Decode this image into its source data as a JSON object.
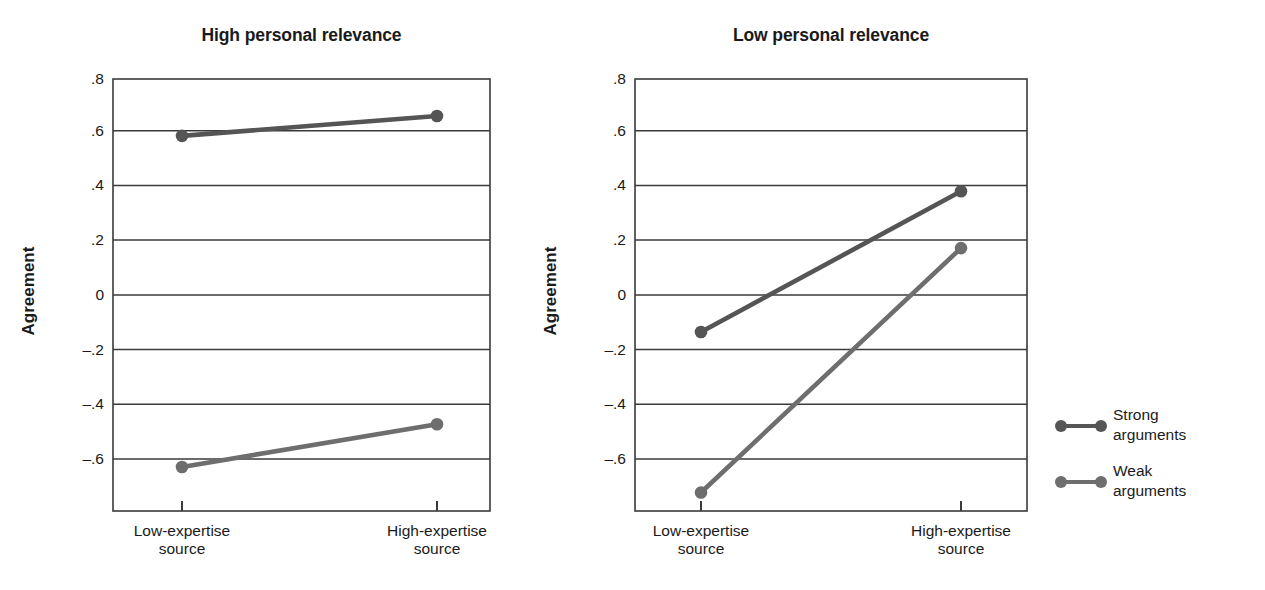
{
  "chart_data": {
    "type": "line",
    "title": "",
    "panels": [
      {
        "title": "High personal relevance",
        "ylabel": "Agreement",
        "xlabel": "",
        "categories": [
          "Low-expertise source",
          "High-expertise source"
        ],
        "category_lines": [
          [
            "Low-expertise",
            "source"
          ],
          [
            "High-expertise",
            "source"
          ]
        ],
        "yticks": [
          ".8",
          ".6",
          ".4",
          ".2",
          "0",
          "–.2",
          "–.4",
          "–.6"
        ],
        "ytick_values": [
          0.8,
          0.6,
          0.4,
          0.2,
          0,
          -0.2,
          -0.4,
          -0.6
        ],
        "ylim": [
          -0.72,
          0.8
        ],
        "grid": true,
        "series": [
          {
            "name": "Strong arguments",
            "values": [
              0.6,
              0.67
            ]
          },
          {
            "name": "Weak arguments",
            "values": [
              -0.565,
              -0.415
            ]
          }
        ]
      },
      {
        "title": "Low personal relevance",
        "ylabel": "Agreement",
        "xlabel": "",
        "categories": [
          "Low-expertise source",
          "High-expertise source"
        ],
        "category_lines": [
          [
            "Low-expertise",
            "source"
          ],
          [
            "High-expertise",
            "source"
          ]
        ],
        "yticks": [
          ".8",
          ".6",
          ".4",
          ".2",
          "0",
          "–.2",
          "–.4",
          "–.6"
        ],
        "ytick_values": [
          0.8,
          0.6,
          0.4,
          0.2,
          0,
          -0.2,
          -0.4,
          -0.6
        ],
        "ylim": [
          -0.72,
          0.8
        ],
        "grid": true,
        "series": [
          {
            "name": "Strong arguments",
            "values": [
              -0.09,
              0.405
            ]
          },
          {
            "name": "Weak arguments",
            "values": [
              -0.655,
              0.205
            ]
          }
        ]
      }
    ],
    "legend": {
      "position": "right",
      "entries": [
        {
          "label": "Strong arguments",
          "lines": [
            "Strong",
            "arguments"
          ],
          "color": "#555555"
        },
        {
          "label": "Weak arguments",
          "lines": [
            "Weak",
            "arguments"
          ],
          "color": "#6e6e6e"
        }
      ]
    },
    "colors": {
      "strong": "#555555",
      "weak": "#6e6e6e",
      "axis": "#3a3a3a",
      "grid": "#3a3a3a",
      "text": "#1a1a1a",
      "background": "#ffffff"
    }
  }
}
